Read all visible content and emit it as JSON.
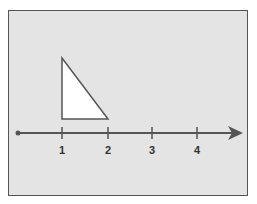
{
  "diagram": {
    "type": "number-line-with-triangle",
    "background_color": "#e4e4e4",
    "stroke_color": "#555555",
    "number_line": {
      "y": 133,
      "start_x": 18,
      "arrow_tip_x": 243,
      "ticks": [
        {
          "value": "1",
          "x": 62
        },
        {
          "value": "2",
          "x": 108
        },
        {
          "value": "3",
          "x": 152
        },
        {
          "value": "4",
          "x": 197
        }
      ]
    },
    "triangle": {
      "fill": "#ffffff",
      "points": [
        [
          62,
          58
        ],
        [
          62,
          119
        ],
        [
          108,
          119
        ]
      ]
    }
  }
}
